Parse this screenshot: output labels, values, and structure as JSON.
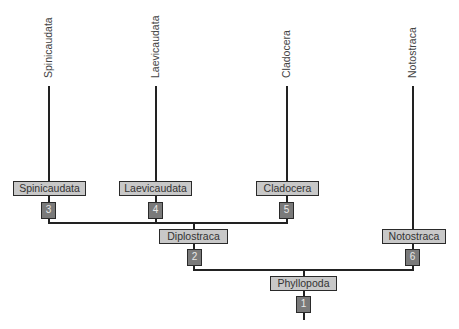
{
  "diagram": {
    "type": "cladogram",
    "leaves": [
      {
        "label": "Spinicaudata"
      },
      {
        "label": "Laevicaudata"
      },
      {
        "label": "Cladocera"
      },
      {
        "label": "Notostraca"
      }
    ],
    "taxa": {
      "spinicaudata": "Spinicaudata",
      "laevicaudata": "Laevicaudata",
      "cladocera": "Cladocera",
      "diplostraca": "Diplostraca",
      "notostraca": "Notostraca",
      "phyllopoda": "Phyllopoda"
    },
    "nodes": {
      "n1": "1",
      "n2": "2",
      "n3": "3",
      "n4": "4",
      "n5": "5",
      "n6": "6"
    },
    "colors": {
      "line": "#222222",
      "taxon_box": "#c8c8c8",
      "node_box": "#7a7a7a"
    }
  }
}
